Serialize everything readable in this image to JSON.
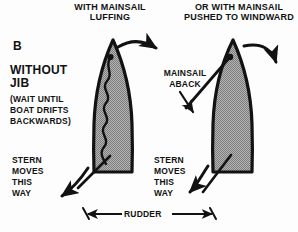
{
  "figure": {
    "panel_letter": "B",
    "type": "diagram",
    "background_color": "#fdfdfd",
    "ink_color": "#121212",
    "hull_fill_color": "#9a9a9a"
  },
  "titles": {
    "left": "WITH MAINSAIL\nLUFFING",
    "right": "OR WITH MAINSAIL\nPUSHED TO WINDWARD"
  },
  "left_text_block": {
    "heading": "WITHOUT\nJIB",
    "note": "(WAIT UNTIL\nBOAT DRIFTS\nBACKWARDS)"
  },
  "callouts": {
    "mainsail_aback": "MAINSAIL\nABACK",
    "stern_left": "STERN\nMOVES\nTHIS\nWAY",
    "stern_right": "STERN\nMOVES\nTHIS\nWAY",
    "rudder": "RUDDER"
  },
  "boats": [
    {
      "id": "boat-left",
      "label": "boat with mainsail luffing",
      "sail_state": "luffing",
      "sail_render": "wavy line along centerline",
      "rudder_direction": "to port / lower-left",
      "bow_arrow": "curved arrow pointing right",
      "stern_arrow": "curved arrow pointing down-left"
    },
    {
      "id": "boat-right",
      "label": "boat with mainsail pushed to windward",
      "sail_state": "aback",
      "sail_render": "straight boom crossing to port",
      "rudder_direction": "to port / lower-left",
      "bow_arrow": "curved arrow pointing down-right",
      "stern_arrow": "curved arrow pointing down-left"
    }
  ],
  "icons": {
    "bow_arrow": "curved-arrow-icon",
    "stern_arrow": "curved-arrow-icon",
    "aback_arrow": "straight-arrow-icon",
    "rudder_arrow": "double-headed-arrow-icon"
  }
}
